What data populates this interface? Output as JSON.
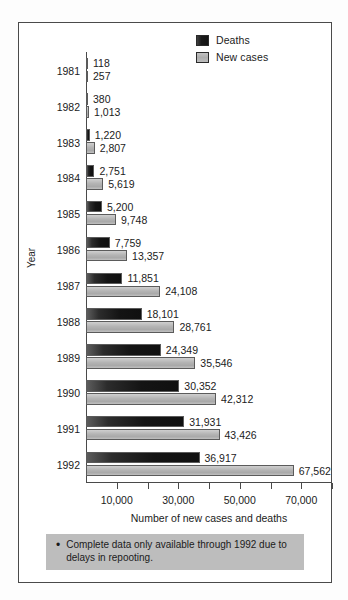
{
  "chart_data": {
    "type": "bar",
    "orientation": "horizontal",
    "title": "",
    "xlabel": "Number of new cases and deaths",
    "ylabel": "Year",
    "categories": [
      "1981",
      "1982",
      "1983",
      "1984",
      "1985",
      "1986",
      "1987",
      "1988",
      "1989",
      "1990",
      "1991",
      "1992"
    ],
    "series": [
      {
        "name": "Deaths",
        "color": "#141414",
        "values": [
          118,
          380,
          1220,
          2751,
          5200,
          7759,
          11851,
          18101,
          24349,
          30352,
          31931,
          36917
        ],
        "value_labels": [
          "118",
          "380",
          "1,220",
          "2,751",
          "5,200",
          "7,759",
          "11,851",
          "18,101",
          "24,349",
          "30,352",
          "31,931",
          "36,917"
        ]
      },
      {
        "name": "New cases",
        "color": "#b4b4b4",
        "values": [
          257,
          1013,
          2807,
          5619,
          9748,
          13357,
          24108,
          28761,
          35546,
          42312,
          43426,
          67562
        ],
        "value_labels": [
          "257",
          "1,013",
          "2,807",
          "5,619",
          "9,748",
          "13,357",
          "24,108",
          "28,761",
          "35,546",
          "42,312",
          "43,426",
          "67,562"
        ]
      }
    ],
    "xlim": [
      0,
      80000
    ],
    "xticks": [
      10000,
      20000,
      30000,
      40000,
      50000,
      60000,
      70000,
      80000
    ],
    "xtick_labels": [
      {
        "value": 10000,
        "label": "10,000"
      },
      {
        "value": 30000,
        "label": "30,000"
      },
      {
        "value": 50000,
        "label": "50,000"
      },
      {
        "value": 70000,
        "label": "70,000"
      }
    ],
    "grid": false,
    "legend_position": "top-right"
  },
  "legend": {
    "items": [
      {
        "label": "Deaths",
        "swatch": "dark-swatch"
      },
      {
        "label": "New cases",
        "swatch": "light-swatch"
      }
    ]
  },
  "footnote": {
    "bullet": "•",
    "text": "Complete data only available through 1992 due to delays in repooting."
  }
}
